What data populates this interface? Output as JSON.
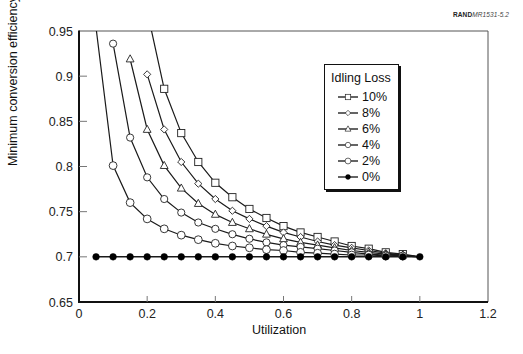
{
  "credit": {
    "bold": "RAND",
    "italic": "MR1531-5.2"
  },
  "legend": {
    "title": "Idling Loss",
    "entries": [
      {
        "label": "10%",
        "marker": "square"
      },
      {
        "label": "8%",
        "marker": "diamond"
      },
      {
        "label": "6%",
        "marker": "triangle"
      },
      {
        "label": "4%",
        "marker": "circle-small"
      },
      {
        "label": "2%",
        "marker": "circle"
      },
      {
        "label": "0%",
        "marker": "filled-circle"
      }
    ]
  },
  "axes": {
    "xlabel": "Utilization",
    "ylabel": "Minimum conversion efficiency"
  },
  "chart_data": {
    "type": "line",
    "title": "",
    "xlabel": "Utilization",
    "ylabel": "Minimum conversion efficiency",
    "xlim": [
      0,
      1.2
    ],
    "ylim": [
      0.65,
      0.95
    ],
    "xticks": [
      0,
      0.2,
      0.4,
      0.6,
      0.8,
      1,
      1.2
    ],
    "xtick_labels": [
      "0",
      "0.2",
      "0.4",
      "0.6",
      "0.8",
      "1",
      "1.2"
    ],
    "yticks": [
      0.65,
      0.7,
      0.75,
      0.8,
      0.85,
      0.9,
      0.95
    ],
    "ytick_labels": [
      "0.65",
      "0.7",
      "0.75",
      "0.8",
      "0.85",
      "0.9",
      "0.95"
    ],
    "grid": false,
    "legend_title": "Idling Loss",
    "legend_position": "upper right (inside plot)",
    "x": [
      0.05,
      0.1,
      0.15,
      0.2,
      0.25,
      0.3,
      0.35,
      0.4,
      0.45,
      0.5,
      0.55,
      0.6,
      0.65,
      0.7,
      0.75,
      0.8,
      0.85,
      0.9,
      0.95,
      1.0
    ],
    "series": [
      {
        "name": "10%",
        "marker": "square",
        "values": [
          null,
          null,
          null,
          0.972,
          0.886,
          0.837,
          0.805,
          0.782,
          0.766,
          0.753,
          0.743,
          0.734,
          0.727,
          0.722,
          0.717,
          0.712,
          0.709,
          0.705,
          0.703,
          0.7
        ],
        "marker_from": 0.25
      },
      {
        "name": "8%",
        "marker": "diamond",
        "values": [
          null,
          null,
          null,
          0.902,
          0.841,
          0.805,
          0.781,
          0.764,
          0.751,
          0.742,
          0.734,
          0.727,
          0.722,
          0.717,
          0.713,
          0.71,
          0.707,
          0.704,
          0.702,
          0.7
        ],
        "marker_from": 0.2
      },
      {
        "name": "6%",
        "marker": "triangle",
        "values": [
          null,
          null,
          0.919,
          0.841,
          0.801,
          0.776,
          0.759,
          0.747,
          0.738,
          0.731,
          0.725,
          0.72,
          0.716,
          0.713,
          0.71,
          0.707,
          0.705,
          0.703,
          0.702,
          0.7
        ],
        "marker_from": 0.15
      },
      {
        "name": "4%",
        "marker": "circle-small",
        "values": [
          null,
          0.936,
          0.832,
          0.788,
          0.764,
          0.749,
          0.738,
          0.731,
          0.725,
          0.72,
          0.716,
          0.713,
          0.711,
          0.709,
          0.707,
          0.705,
          0.703,
          0.702,
          0.701,
          0.7
        ],
        "marker_from": 0.1
      },
      {
        "name": "2%",
        "marker": "circle",
        "values": [
          0.954,
          0.801,
          0.76,
          0.742,
          0.731,
          0.724,
          0.719,
          0.715,
          0.712,
          0.71,
          0.708,
          0.707,
          0.705,
          0.704,
          0.703,
          0.702,
          0.702,
          0.701,
          0.701,
          0.7
        ],
        "marker_from": 0.1
      },
      {
        "name": "0%",
        "marker": "filled-circle",
        "values": [
          0.7,
          0.7,
          0.7,
          0.7,
          0.7,
          0.7,
          0.7,
          0.7,
          0.7,
          0.7,
          0.7,
          0.7,
          0.7,
          0.7,
          0.7,
          0.7,
          0.7,
          0.7,
          0.7,
          0.7
        ],
        "marker_from": 0.05
      }
    ]
  },
  "colors": {
    "line": "#1a1a1a",
    "axis": "#111111",
    "marker_fill": "#ffffff",
    "background": "#ffffff"
  }
}
